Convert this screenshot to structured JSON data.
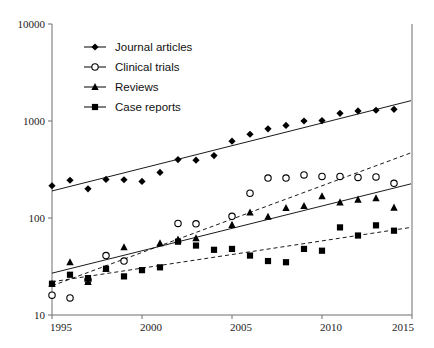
{
  "chart_data": {
    "type": "line",
    "title": "",
    "subtitle": "",
    "xlabel": "",
    "ylabel": "",
    "xlim": [
      1995,
      2015
    ],
    "ylim": [
      10,
      10000
    ],
    "yscale": "log",
    "grid": false,
    "legend_position": "top-left",
    "x_ticks": [
      "1995",
      "2000",
      "2005",
      "2010",
      "2015"
    ],
    "x_tick_values": [
      1995,
      2000,
      2005,
      2010,
      2015
    ],
    "y_ticks": [
      "10000",
      "1000",
      "100",
      "10"
    ],
    "y_tick_values": [
      10000,
      1000,
      100,
      10
    ],
    "x": [
      1995,
      1996,
      1997,
      1998,
      1999,
      2000,
      2001,
      2002,
      2003,
      2004,
      2005,
      2006,
      2007,
      2008,
      2009,
      2010,
      2011,
      2012,
      2013,
      2014
    ],
    "series": [
      {
        "name": "Journal articles",
        "marker": "filled-diamond",
        "trend": "solid",
        "values": [
          215,
          245,
          200,
          250,
          248,
          238,
          295,
          400,
          395,
          440,
          620,
          730,
          830,
          900,
          1000,
          1010,
          1200,
          1270,
          1290,
          1320
        ],
        "trend_endpoints": [
          190,
          1620
        ]
      },
      {
        "name": "Clinical trials",
        "marker": "open-circle",
        "trend": "dashed",
        "values": [
          16,
          15,
          23,
          41,
          36,
          null,
          null,
          88,
          87,
          null,
          104,
          180,
          258,
          258,
          278,
          268,
          268,
          262,
          265,
          228
        ],
        "trend_endpoints": [
          20,
          470
        ]
      },
      {
        "name": "Reviews",
        "marker": "filled-triangle",
        "trend": "solid",
        "values": [
          21,
          35,
          22,
          30,
          50,
          null,
          55,
          60,
          62,
          null,
          85,
          114,
          103,
          127,
          133,
          168,
          145,
          155,
          160,
          128
        ],
        "trend_endpoints": [
          27,
          225
        ]
      },
      {
        "name": "Case reports",
        "marker": "filled-square",
        "trend": "dashed",
        "values": [
          21,
          26,
          24,
          30,
          25,
          29,
          31,
          57,
          52,
          47,
          48,
          41,
          36,
          35,
          48,
          46,
          80,
          66,
          84,
          74
        ],
        "trend_endpoints": [
          22,
          80
        ]
      }
    ]
  },
  "legend": {
    "items": [
      {
        "label": "Journal articles",
        "marker": "filled-diamond"
      },
      {
        "label": "Clinical trials",
        "marker": "open-circle"
      },
      {
        "label": "Reviews",
        "marker": "filled-triangle"
      },
      {
        "label": "Case reports",
        "marker": "filled-square"
      }
    ]
  },
  "colors": {
    "marker": "#000000",
    "axis": "#6f6f6f",
    "text": "#222222",
    "background": "#ffffff"
  }
}
